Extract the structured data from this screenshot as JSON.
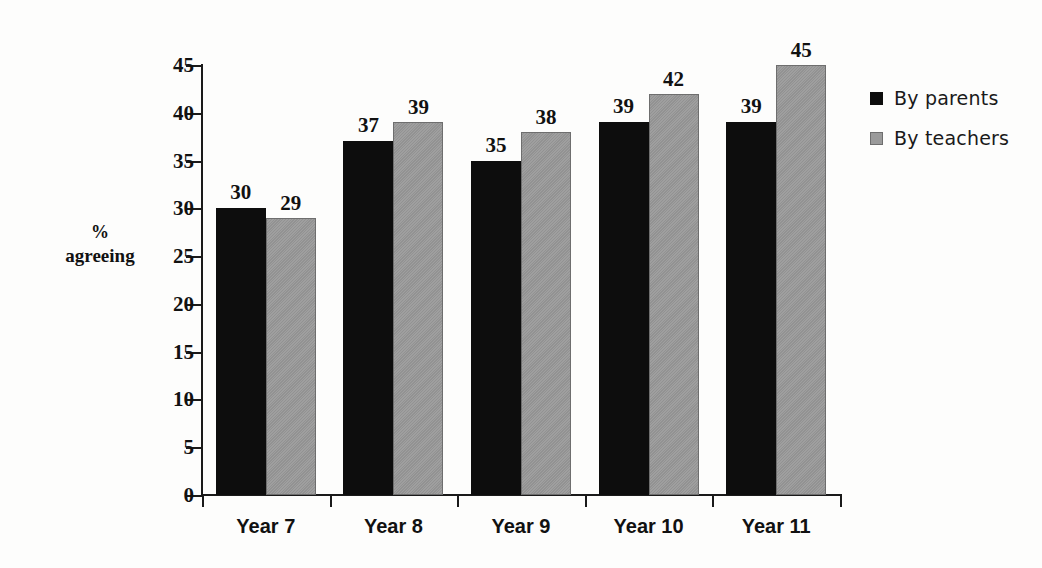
{
  "chart_data": {
    "type": "bar",
    "title": "",
    "xlabel": "",
    "ylabel": "% agreeing",
    "ylabel_lines": [
      "%",
      "agreeing"
    ],
    "categories": [
      "Year 7",
      "Year 8",
      "Year 9",
      "Year 10",
      "Year 11"
    ],
    "series": [
      {
        "name": "By parents",
        "color": "#0d0d0d",
        "values": [
          30,
          37,
          35,
          39,
          39
        ]
      },
      {
        "name": "By teachers",
        "color": "#9a9a9a",
        "values": [
          29,
          39,
          38,
          42,
          45
        ]
      }
    ],
    "ylim": [
      0,
      45
    ],
    "ytick_values": [
      0,
      5,
      10,
      15,
      20,
      25,
      30,
      35,
      40,
      45
    ],
    "ytick_labels": [
      "0",
      "5",
      "10",
      "15",
      "20",
      "25",
      "30",
      "35",
      "40",
      "45"
    ],
    "grid": false,
    "data_labels": true,
    "legend_position": "right"
  },
  "legend": {
    "items": [
      {
        "label": "By parents",
        "swatch": "black-square-swatch"
      },
      {
        "label": "By teachers",
        "swatch": "gray-square-swatch"
      }
    ]
  }
}
